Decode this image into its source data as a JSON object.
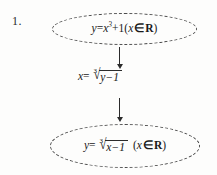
{
  "diagram": {
    "item_number": "1.",
    "type": "flowchart",
    "orientation": "vertical",
    "node_shape": "ellipse",
    "node_border_style": "dashed",
    "accent_color": "#2b2b2b",
    "background_color": "#fdfdfc",
    "nodes": [
      {
        "id": "top",
        "shape": "ellipse",
        "expression_plain": "y=x^3+1(x ∈ R)",
        "parts": {
          "lhs_var": "y",
          "equals": "=",
          "base_var": "x",
          "exponent": "3",
          "plus": "+1",
          "open_paren": "(",
          "domain_var": "x",
          "member_symbol": "∈",
          "set_symbol": "R",
          "close_paren": ")"
        }
      },
      {
        "id": "middle",
        "shape": "none",
        "expression_plain": "x= ∛(y−1)",
        "parts": {
          "lhs_var": "x",
          "equals": "=",
          "radical_index": "3",
          "radical_sign": "√",
          "radicand": "y−1"
        }
      },
      {
        "id": "bottom",
        "shape": "ellipse",
        "expression_plain": "y= ∛(x−1) (x ∈ R)",
        "parts": {
          "lhs_var": "y",
          "equals": "=",
          "radical_index": "3",
          "radical_sign": "√",
          "radicand": "x−1",
          "open_paren": "(",
          "domain_var": "x",
          "member_symbol": "∈",
          "set_symbol": "R",
          "close_paren": ")"
        }
      }
    ],
    "connectors": [
      {
        "id": "arrow-1",
        "from": "top",
        "to": "middle",
        "icon": "arrow-down-icon",
        "direction": "down"
      },
      {
        "id": "arrow-2",
        "from": "middle",
        "to": "bottom",
        "icon": "arrow-down-icon",
        "direction": "down"
      }
    ]
  }
}
